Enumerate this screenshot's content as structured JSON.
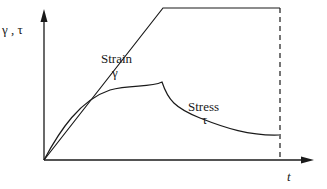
{
  "diagram": {
    "y_axis_label": "γ , τ",
    "x_axis_label": "t",
    "curves": [
      {
        "name": "strain",
        "label_line1": "Strain",
        "label_line2": "γ",
        "description": "linear ramp then constant"
      },
      {
        "name": "stress",
        "label_line1": "Stress",
        "label_line2": "τ",
        "description": "rises concave then relaxes/decays"
      }
    ],
    "marker": "dashed vertical line at end of observation"
  },
  "colors": {
    "line": "#1a1a1a",
    "background": "#ffffff"
  }
}
